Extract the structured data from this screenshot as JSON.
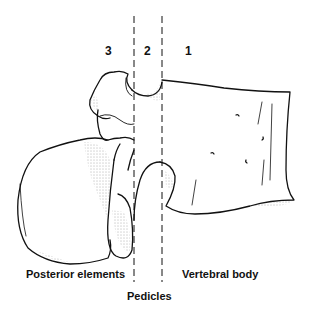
{
  "diagram": {
    "zones": [
      {
        "number": "3",
        "name": "Posterior elements"
      },
      {
        "number": "2",
        "name": "Pedicles"
      },
      {
        "number": "1",
        "name": "Vertebral body"
      }
    ],
    "labels": {
      "zone3_number": "3",
      "zone2_number": "2",
      "zone1_number": "1",
      "posterior": "Posterior elements",
      "body": "Vertebral body",
      "pedicles": "Pedicles"
    },
    "divider_lines": [
      {
        "x": 134,
        "style": "dashed"
      },
      {
        "x": 162,
        "style": "dashed"
      }
    ],
    "colors": {
      "line": "#111111",
      "background": "#ffffff",
      "stipple": "#555555"
    }
  }
}
